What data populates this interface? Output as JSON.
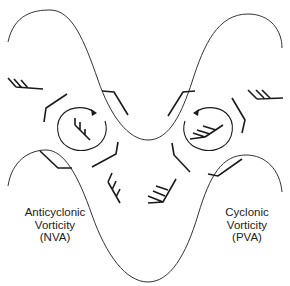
{
  "diagram": {
    "type": "upper-level trough wind pattern",
    "labels": {
      "left": {
        "line1": "Anticyclonic",
        "line2": "Vorticity",
        "line3": "(NVA)"
      },
      "right": {
        "line1": "Cyclonic",
        "line2": "Vorticity",
        "line3": "(PVA)"
      }
    },
    "elements": {
      "contours": [
        "upper-height-contour",
        "lower-height-contour"
      ],
      "circulations": [
        "anticyclonic-circle-left",
        "cyclonic-circle-right"
      ],
      "wind_barbs_count": 14
    },
    "colors": {
      "line": "#1a1a1a",
      "background": "#ffffff"
    }
  }
}
